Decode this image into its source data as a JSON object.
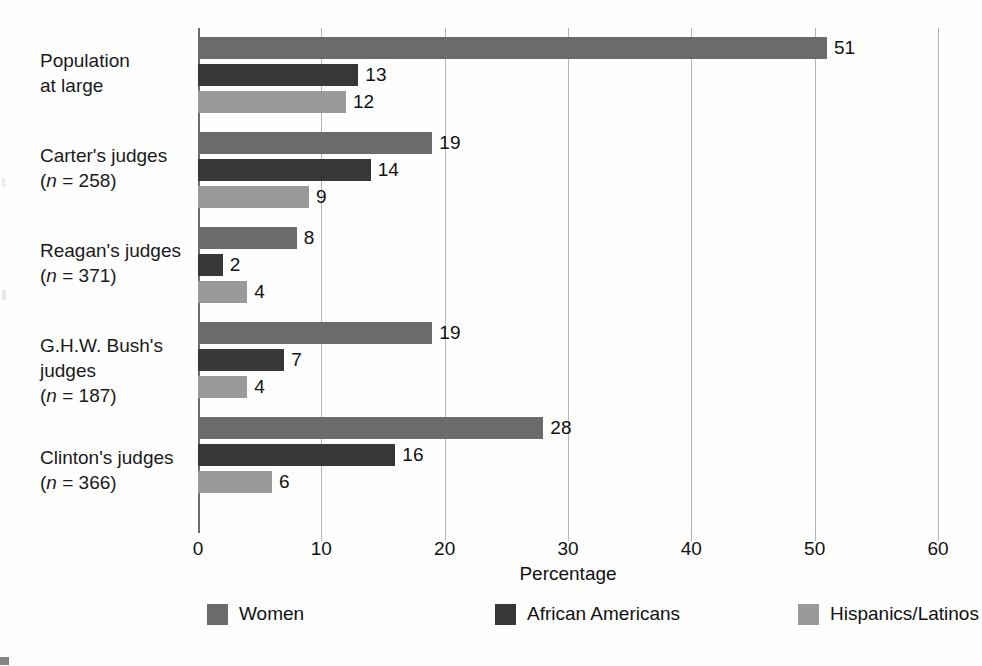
{
  "chart_data": {
    "type": "bar",
    "orientation": "horizontal",
    "title": "",
    "xlabel": "Percentage",
    "ylabel": "",
    "xlim": [
      0,
      60
    ],
    "xticks": [
      "0",
      "10",
      "20",
      "30",
      "40",
      "50",
      "60"
    ],
    "grid": true,
    "legend_position": "bottom",
    "categories": [
      "Population at large",
      "Carter's judges (n = 258)",
      "Reagan's judges (n = 371)",
      "G.H.W. Bush's judges (n = 187)",
      "Clinton's judges (n = 366)"
    ],
    "category_lines": [
      [
        "Population",
        "at large"
      ],
      [
        "Carter's judges",
        "(n = 258)"
      ],
      [
        "Reagan's judges",
        "(n = 371)"
      ],
      [
        "G.H.W. Bush's",
        "judges",
        "(n = 187)"
      ],
      [
        "Clinton's judges",
        "(n = 366)"
      ]
    ],
    "series": [
      {
        "name": "Women",
        "color": "#6b6b6b",
        "values": [
          51,
          19,
          8,
          19,
          28
        ]
      },
      {
        "name": "African Americans",
        "color": "#373737",
        "values": [
          13,
          14,
          2,
          7,
          16
        ]
      },
      {
        "name": "Hispanics/Latinos",
        "color": "#9a9a9a",
        "values": [
          12,
          9,
          4,
          4,
          6
        ]
      }
    ],
    "data_labels": [
      [
        "51",
        "13",
        "12"
      ],
      [
        "19",
        "14",
        "9"
      ],
      [
        "8",
        "2",
        "4"
      ],
      [
        "19",
        "7",
        "4"
      ],
      [
        "28",
        "16",
        "6"
      ]
    ]
  },
  "axis": {
    "x_title": "Percentage",
    "ticks": [
      {
        "label": "0",
        "value": 0
      },
      {
        "label": "10",
        "value": 10
      },
      {
        "label": "20",
        "value": 20
      },
      {
        "label": "30",
        "value": 30
      },
      {
        "label": "40",
        "value": 40
      },
      {
        "label": "50",
        "value": 50
      },
      {
        "label": "60",
        "value": 60
      }
    ]
  },
  "legend": {
    "items": [
      {
        "label": "Women",
        "color": "#6b6b6b"
      },
      {
        "label": "African Americans",
        "color": "#373737"
      },
      {
        "label": "Hispanics/Latinos",
        "color": "#9a9a9a"
      }
    ]
  },
  "categories": [
    {
      "line1": "Population",
      "line2": "at large",
      "line3": "",
      "n_prefix": "",
      "n_value": ""
    },
    {
      "line1": "Carter's judges",
      "line2": "",
      "line3": "",
      "n_prefix": "(n",
      "n_value": " = 258)"
    },
    {
      "line1": "Reagan's judges",
      "line2": "",
      "line3": "",
      "n_prefix": "(n",
      "n_value": " = 371)"
    },
    {
      "line1": "G.H.W. Bush's",
      "line2": "judges",
      "line3": "",
      "n_prefix": "(n",
      "n_value": " = 187)"
    },
    {
      "line1": "Clinton's judges",
      "line2": "",
      "line3": "",
      "n_prefix": "(n",
      "n_value": " = 366)"
    }
  ]
}
